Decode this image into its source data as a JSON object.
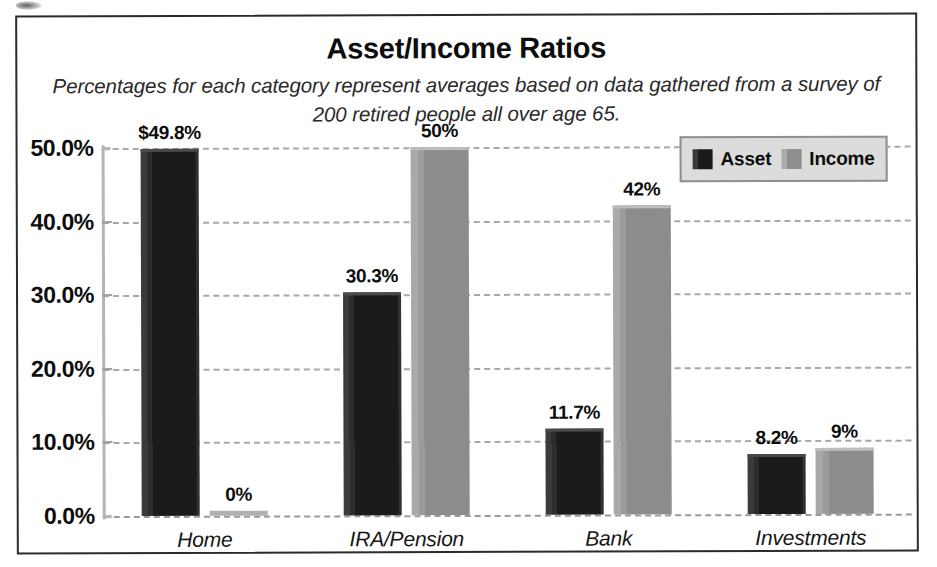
{
  "chart_data": {
    "type": "bar",
    "title": "Asset/Income Ratios",
    "subtitle": "Percentages for each category represent averages based on data gathered from a survey of 200 retired people all over age 65.",
    "categories": [
      "Home",
      "IRA/Pension",
      "Bank",
      "Investments"
    ],
    "series": [
      {
        "name": "Asset",
        "color": "#1b1b1b",
        "values": [
          49.8,
          30.3,
          11.7,
          8.2
        ],
        "labels": [
          "$49.8%",
          "30.3%",
          "11.7%",
          "8.2%"
        ]
      },
      {
        "name": "Income",
        "color": "#8e8e8e",
        "values": [
          0,
          50,
          42,
          9
        ],
        "labels": [
          "0%",
          "50%",
          "42%",
          "9%"
        ]
      }
    ],
    "xlabel": "",
    "ylabel": "",
    "ylim": [
      0,
      50
    ],
    "yticks": [
      0,
      10,
      20,
      30,
      40,
      50
    ],
    "ytick_labels": [
      "0.0%",
      "10.0%",
      "20.0%",
      "30.0%",
      "40.0%",
      "50.0%"
    ],
    "grid": true,
    "grid_style": "dashed",
    "legend": {
      "position": "top-right",
      "entries": [
        "Asset",
        "Income"
      ],
      "background": "#dcdcdc",
      "border": "#8f8f8f"
    },
    "frame": {
      "border_color": "#2b2b2b"
    }
  }
}
